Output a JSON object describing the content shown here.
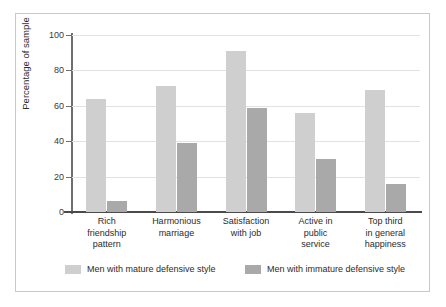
{
  "chart_data": {
    "type": "bar",
    "title": "",
    "xlabel": "",
    "ylabel": "Percentage of sample",
    "ylim": [
      0,
      100
    ],
    "yticks": [
      0,
      20,
      40,
      60,
      80,
      100
    ],
    "grid": true,
    "legend_position": "bottom",
    "categories": [
      "Rich friendship pattern",
      "Harmonious marriage",
      "Satisfaction with job",
      "Active in public service",
      "Top third in general happiness"
    ],
    "category_lines": [
      [
        "Rich",
        "friendship",
        "pattern"
      ],
      [
        "Harmonious",
        "marriage"
      ],
      [
        "Satisfaction",
        "with job"
      ],
      [
        "Active in",
        "public",
        "service"
      ],
      [
        "Top third",
        "in general",
        "happiness"
      ]
    ],
    "series": [
      {
        "name": "Men with mature defensive style",
        "color": "#cfcfcf",
        "values": [
          64,
          71,
          91,
          56,
          69
        ]
      },
      {
        "name": "Men with immature defensive style",
        "color": "#a9a9a9",
        "values": [
          6,
          39,
          59,
          30,
          16
        ]
      }
    ]
  },
  "legend": {
    "items": [
      {
        "label": "Men with mature defensive style",
        "swatch": "mature"
      },
      {
        "label": "Men with immature defensive style",
        "swatch": "immature"
      }
    ]
  },
  "axis": {
    "y_title": "Percentage of sample",
    "y_tick_labels": [
      "0",
      "20",
      "40",
      "60",
      "80",
      "100"
    ]
  }
}
